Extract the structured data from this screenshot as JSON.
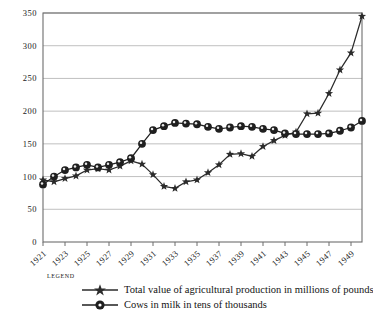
{
  "chart_data": {
    "type": "line",
    "title": "",
    "xlabel": "",
    "ylabel": "",
    "ylim": [
      0,
      350
    ],
    "ytick_values": [
      0,
      50,
      100,
      150,
      200,
      250,
      300,
      350
    ],
    "ytick_labels": [
      "0",
      "50",
      "100",
      "150",
      "200",
      "250",
      "300",
      "350"
    ],
    "grid": true,
    "grid_axis": "y",
    "legend_position": "below-left",
    "x": [
      1921,
      1922,
      1923,
      1924,
      1925,
      1926,
      1927,
      1928,
      1929,
      1930,
      1931,
      1932,
      1933,
      1934,
      1935,
      1936,
      1937,
      1938,
      1939,
      1940,
      1941,
      1942,
      1943,
      1944,
      1945,
      1946,
      1947,
      1948,
      1949,
      1950
    ],
    "xtick_values": [
      1921,
      1923,
      1925,
      1927,
      1929,
      1931,
      1933,
      1935,
      1937,
      1939,
      1941,
      1943,
      1945,
      1947,
      1949
    ],
    "xtick_labels": [
      "1921",
      "1923",
      "1925",
      "1927",
      "1929",
      "1931",
      "1933",
      "1935",
      "1937",
      "1939",
      "1941",
      "1943",
      "1945",
      "1947",
      "1949"
    ],
    "series": [
      {
        "name": "Total value of agricultural production in millions of pounds",
        "marker": "star",
        "color": "#2b2b2b",
        "values": [
          95,
          92,
          97,
          101,
          110,
          112,
          110,
          116,
          124,
          119,
          103,
          85,
          82,
          92,
          95,
          106,
          118,
          134,
          135,
          131,
          146,
          155,
          163,
          168,
          196,
          197,
          227,
          263,
          289,
          345
        ]
      },
      {
        "name": "Cows in milk in tens of thousands",
        "marker": "circle",
        "color": "#1f1f1f",
        "values": [
          88,
          100,
          110,
          114,
          118,
          114,
          118,
          122,
          128,
          150,
          171,
          177,
          182,
          181,
          180,
          176,
          173,
          175,
          177,
          176,
          173,
          171,
          166,
          165,
          165,
          165,
          166,
          170,
          175,
          185
        ]
      }
    ]
  },
  "legend": {
    "title": "Legend",
    "entries": [
      {
        "label": "Total value of agricultural production in millions of pounds",
        "marker": "star-line-icon"
      },
      {
        "label": "Cows in milk in tens of thousands",
        "marker": "circle-line-icon"
      }
    ]
  }
}
